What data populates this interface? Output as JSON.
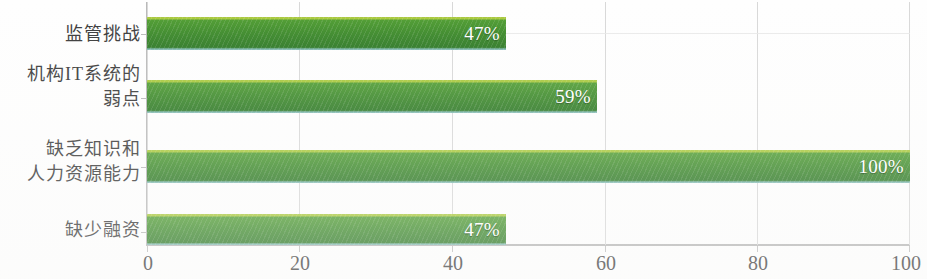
{
  "chart_data": {
    "type": "bar",
    "orientation": "horizontal",
    "title": "",
    "xlabel": "",
    "ylabel": "",
    "xlim": [
      0,
      100
    ],
    "grid": true,
    "legend": "none",
    "xticks": [
      "0",
      "20",
      "40",
      "60",
      "80",
      "100"
    ],
    "xtick_values": [
      0,
      20,
      40,
      60,
      80,
      100
    ],
    "categories": [
      "监管挑战",
      "机构IT系统的\n弱点",
      "缺乏知识和\n人力资源能力",
      "缺少融资"
    ],
    "values": [
      47,
      59,
      100,
      47
    ],
    "value_labels": [
      "47%",
      "59%",
      "100%",
      "47%"
    ],
    "bar_color": "#3f8c2c",
    "bar_highlight_color": "#a8c83c",
    "bar_shadow_color": "#86bcb6",
    "value_label_color": "#ffffff",
    "gridline_color": "#d8d8d8",
    "axis_color": "#b9b9b9",
    "text_color": "#3a3a3a"
  }
}
